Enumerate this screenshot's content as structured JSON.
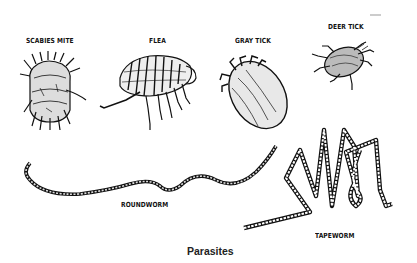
{
  "figure": {
    "caption": "Parasites",
    "labels": {
      "scabies_mite": "SCABIES MITE",
      "flea": "FLEA",
      "gray_tick": "GRAY TICK",
      "deer_tick": "DEER TICK",
      "roundworm": "ROUNDWORM",
      "tapeworm": "TAPEWORM"
    },
    "colors": {
      "ink": "#111111",
      "background": "#ffffff"
    }
  }
}
